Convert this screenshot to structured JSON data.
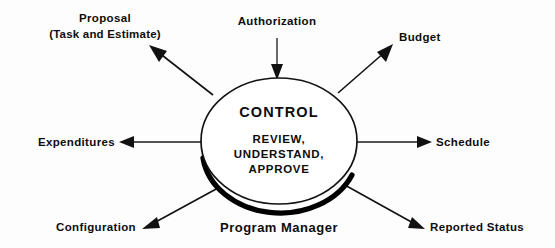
{
  "diagram": {
    "center": {
      "title": "CONTROL",
      "lines": [
        "REVIEW,",
        "UNDERSTAND,",
        "APPROVE"
      ],
      "owner_label": "Program Manager"
    },
    "colors": {
      "background": "#fdfdfd",
      "ink": "#111111",
      "ellipse_fill": "#ffffff",
      "shadow": "#000000"
    },
    "nodes": [
      {
        "id": "proposal",
        "lines": [
          "Proposal",
          "(Task and Estimate)"
        ],
        "direction": "outbound",
        "position": "top-left"
      },
      {
        "id": "authorization",
        "lines": [
          "Authorization"
        ],
        "direction": "inbound",
        "position": "top-center"
      },
      {
        "id": "budget",
        "lines": [
          "Budget"
        ],
        "direction": "outbound",
        "position": "top-right"
      },
      {
        "id": "expenditures",
        "lines": [
          "Expenditures"
        ],
        "direction": "outbound",
        "position": "left"
      },
      {
        "id": "schedule",
        "lines": [
          "Schedule"
        ],
        "direction": "outbound",
        "position": "right"
      },
      {
        "id": "configuration",
        "lines": [
          "Configuration"
        ],
        "direction": "outbound",
        "position": "bottom-left"
      },
      {
        "id": "reported-status",
        "lines": [
          "Reported  Status"
        ],
        "direction": "outbound",
        "position": "bottom-right"
      }
    ]
  }
}
